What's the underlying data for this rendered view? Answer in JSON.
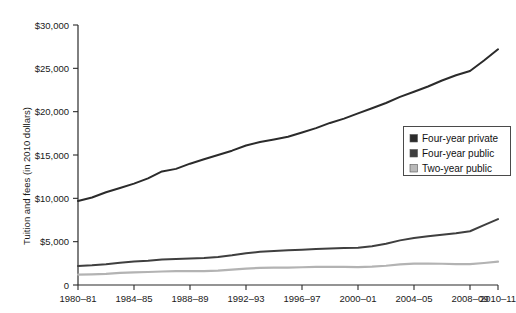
{
  "chart_data": {
    "type": "line",
    "title": "",
    "subtitle": "",
    "xlabel": "",
    "ylabel": "Tuition and fees (in 2010 dollars)",
    "grid": false,
    "legend_position": "right-middle",
    "ylim": [
      0,
      30000
    ],
    "ytick_labels": [
      "$30,000",
      "$25,000",
      "$20,000",
      "$15,000",
      "$10,000",
      "$5,000",
      "0"
    ],
    "ytick_values": [
      30000,
      25000,
      20000,
      15000,
      10000,
      5000,
      0
    ],
    "xtick_labels": [
      "1980–81",
      "1984–85",
      "1988–89",
      "1992–93",
      "1996–97",
      "2000–01",
      "2004–05",
      "2008–09",
      "2010–11"
    ],
    "xtick_values": [
      1980,
      1984,
      1988,
      1992,
      1996,
      2000,
      2004,
      2008,
      2010
    ],
    "x": [
      1980,
      1981,
      1982,
      1983,
      1984,
      1985,
      1986,
      1987,
      1988,
      1989,
      1990,
      1991,
      1992,
      1993,
      1994,
      1995,
      1996,
      1997,
      1998,
      1999,
      2000,
      2001,
      2002,
      2003,
      2004,
      2005,
      2006,
      2007,
      2008,
      2009,
      2010
    ],
    "x_period_labels": [
      "1980–81",
      "1981–82",
      "1982–83",
      "1983–84",
      "1984–85",
      "1985–86",
      "1986–87",
      "1987–88",
      "1988–89",
      "1989–90",
      "1990–91",
      "1991–92",
      "1992–93",
      "1993–94",
      "1994–95",
      "1995–96",
      "1996–97",
      "1997–98",
      "1998–99",
      "1999–2000",
      "2000–01",
      "2001–02",
      "2002–03",
      "2003–04",
      "2004–05",
      "2005–06",
      "2006–07",
      "2007–08",
      "2008–09",
      "2009–10",
      "2010–11"
    ],
    "series": [
      {
        "name": "Four-year private",
        "color": "#2b2b2b",
        "width": 2.0,
        "values": [
          9700,
          10100,
          10700,
          11200,
          11700,
          12300,
          13100,
          13400,
          14000,
          14500,
          15000,
          15500,
          16100,
          16500,
          16800,
          17100,
          17600,
          18100,
          18700,
          19200,
          19800,
          20400,
          21000,
          21700,
          22300,
          22900,
          23600,
          24200,
          24700,
          25900,
          27200
        ]
      },
      {
        "name": "Four-year public",
        "color": "#3f3f3f",
        "width": 2.0,
        "values": [
          2200,
          2280,
          2400,
          2560,
          2700,
          2800,
          2950,
          3000,
          3060,
          3120,
          3230,
          3420,
          3660,
          3830,
          3930,
          4000,
          4080,
          4150,
          4220,
          4270,
          4300,
          4480,
          4760,
          5150,
          5420,
          5620,
          5800,
          5980,
          6200,
          6900,
          7600
        ]
      },
      {
        "name": "Two-year public",
        "color": "#b3b3b3",
        "width": 2.2,
        "values": [
          1200,
          1230,
          1290,
          1390,
          1450,
          1500,
          1560,
          1590,
          1600,
          1610,
          1660,
          1780,
          1900,
          1980,
          2000,
          2010,
          2050,
          2080,
          2090,
          2090,
          2060,
          2120,
          2220,
          2390,
          2470,
          2480,
          2450,
          2420,
          2400,
          2540,
          2700
        ]
      }
    ]
  },
  "legend": {
    "items": [
      {
        "label": "Four-year private",
        "color": "#2b2b2b"
      },
      {
        "label": "Four-year public",
        "color": "#3f3f3f"
      },
      {
        "label": "Two-year public",
        "color": "#b9b9b9"
      }
    ]
  }
}
